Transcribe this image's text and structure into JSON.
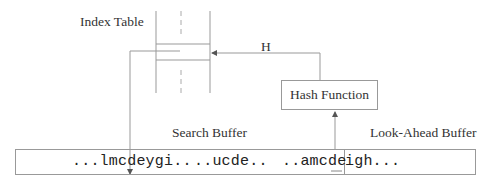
{
  "diagram": {
    "index_table": {
      "label": "Index Table"
    },
    "hash_function": {
      "label": "Hash Function"
    },
    "hash_arrow": {
      "label": "H"
    },
    "search_buffer": {
      "label": "Search Buffer"
    },
    "look_ahead_buffer": {
      "label": "Look-Ahead Buffer"
    },
    "buffer": {
      "segments": [
        {
          "text": "...lmcdeygi.."
        },
        {
          "text": "..ucde.."
        },
        {
          "text": "..amcde"
        },
        {
          "text": "igh..."
        }
      ]
    },
    "colors": {
      "line": "#999999",
      "dashed": "#aaaaaa",
      "text": "#222222"
    }
  }
}
